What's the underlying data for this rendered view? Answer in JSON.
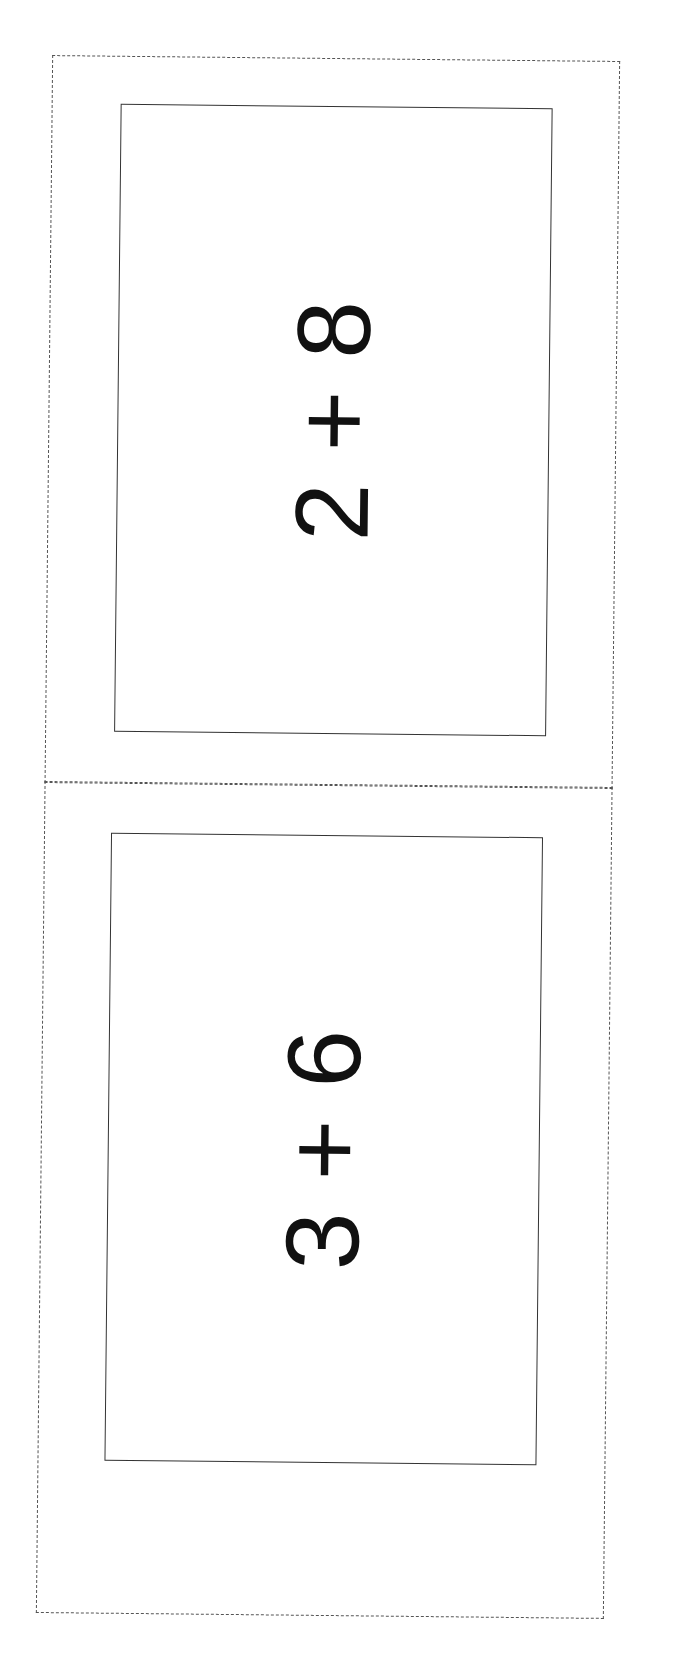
{
  "cards": [
    {
      "left_operand": "2",
      "operator": "+",
      "right_operand": "8"
    },
    {
      "left_operand": "3",
      "operator": "+",
      "right_operand": "6"
    }
  ]
}
